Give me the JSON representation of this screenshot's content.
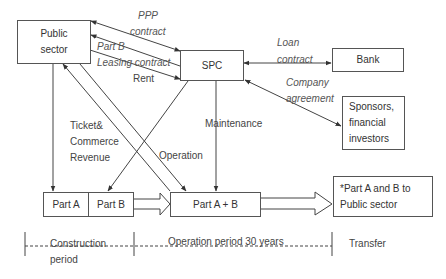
{
  "nodes": {
    "public_sector": "Public sector",
    "spc": "SPC",
    "bank": "Bank",
    "sponsors": "Sponsors, financial investors",
    "part_a": "Part A",
    "part_b": "Part B",
    "part_ab": "Part A + B",
    "transfer_box": "*Part A and B to Public sector"
  },
  "edges": {
    "ppp_line1": "PPP",
    "ppp_line2": "contract",
    "partb": "Part B",
    "leasing": "Leasing contract",
    "rent": "Rent",
    "loan_line1": "Loan",
    "loan_line2": "contract",
    "company_line1": "Company",
    "company_line2": "agreement",
    "ticket_line1": "Ticket&",
    "ticket_line2": "Commerce",
    "ticket_line3": "Revenue",
    "operation": "Operation",
    "maintenance": "Maintenance"
  },
  "timeline": {
    "construction_line1": "Construction",
    "construction_line2": "period",
    "operation": "Operation period 30 years",
    "transfer": "Transfer"
  },
  "colors": {
    "line": "#444444",
    "box_border": "#555555",
    "text": "#333333"
  }
}
